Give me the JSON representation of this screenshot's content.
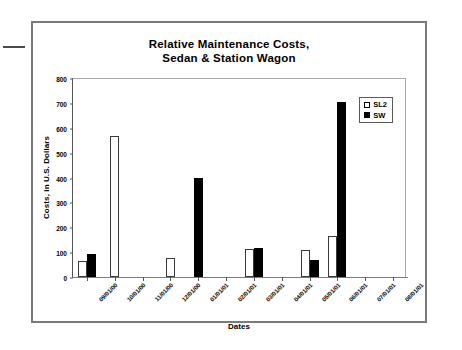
{
  "chart_data": {
    "type": "bar",
    "title": "Relative Maintenance Costs, Sedan & Station Wagon",
    "title_lines": [
      "Relative Maintenance Costs,",
      "Sedan & Station Wagon"
    ],
    "xlabel": "Dates",
    "ylabel": "Costs, in U.S. Dollars",
    "ylim": [
      0,
      800
    ],
    "ytick_values": [
      0,
      100,
      200,
      300,
      400,
      500,
      600,
      700,
      800
    ],
    "ytick_labels": [
      "0",
      "100",
      "200",
      "300",
      "400",
      "500",
      "600",
      "700",
      "800"
    ],
    "grid": false,
    "legend_position": "top-right-inside",
    "categories": [
      "09/01/00",
      "10/01/00",
      "11/01/00",
      "12/01/00",
      "01/01/01",
      "02/01/01",
      "03/01/01",
      "04/01/01",
      "05/01/01",
      "06/01/01",
      "07/01/01",
      "08/01/01"
    ],
    "series": [
      {
        "name": "SL2",
        "color": "#ffffff",
        "edge_color": "#000000",
        "values": [
          63,
          567,
          0,
          78,
          0,
          0,
          113,
          0,
          107,
          163,
          0,
          0
        ]
      },
      {
        "name": "SW",
        "color": "#000000",
        "edge_color": "#000000",
        "values": [
          91,
          0,
          0,
          0,
          400,
          0,
          117,
          0,
          70,
          705,
          0,
          0
        ]
      }
    ]
  },
  "legend": {
    "items": [
      {
        "label": "SL2",
        "swatch": "white-square"
      },
      {
        "label": "SW",
        "swatch": "black-square"
      }
    ]
  }
}
